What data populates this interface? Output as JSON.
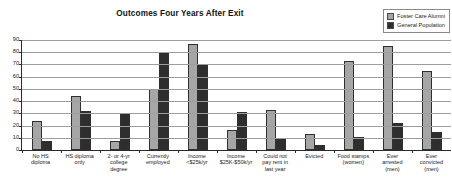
{
  "chart_data": {
    "type": "bar",
    "title": "Outcomes Four Years After Exit",
    "xlabel": "",
    "ylabel": "",
    "ylim": [
      0,
      90
    ],
    "yticks": [
      0,
      10,
      20,
      30,
      40,
      50,
      60,
      70,
      80,
      90
    ],
    "grid": true,
    "legend_position": "top-right",
    "categories": [
      "No HS diploma",
      "HS diploma only",
      "2- or 4-yr college degree",
      "Currently employed",
      "Income <$25k/yr",
      "Income $25K-$50k/yr",
      "Could not pay rent in last year",
      "Evicted",
      "Food stamps (women)",
      "Ever arrested (men)",
      "Ever convicted (men)"
    ],
    "category_lines": [
      [
        "No HS",
        "diploma"
      ],
      [
        "HS diploma",
        "only"
      ],
      [
        "2- or 4-yr",
        "college",
        "degree"
      ],
      [
        "Currently",
        "employed"
      ],
      [
        "Income",
        "<$25k/yr"
      ],
      [
        "Income",
        "$25K-$50k/yr"
      ],
      [
        "Could not",
        "pay rent in",
        "last year"
      ],
      [
        "Evicted"
      ],
      [
        "Food stamps",
        "(women)"
      ],
      [
        "Ever",
        "arrested",
        "(men)"
      ],
      [
        "Ever",
        "convicted",
        "(men)"
      ]
    ],
    "series": [
      {
        "name": "Foster Care Alumni",
        "color": "#a6a6a6",
        "values": [
          24,
          44,
          7,
          50,
          87,
          16,
          33,
          13,
          73,
          85,
          65
        ]
      },
      {
        "name": "General Population",
        "color": "#2e2e2e",
        "values": [
          7,
          32,
          30,
          80,
          70,
          31,
          10,
          4,
          11,
          22,
          15
        ]
      }
    ]
  },
  "legend": {
    "items": [
      {
        "label": "Foster Care Alumni",
        "swatch": "#a6a6a6"
      },
      {
        "label": "General Population",
        "swatch": "#2e2e2e"
      }
    ]
  }
}
